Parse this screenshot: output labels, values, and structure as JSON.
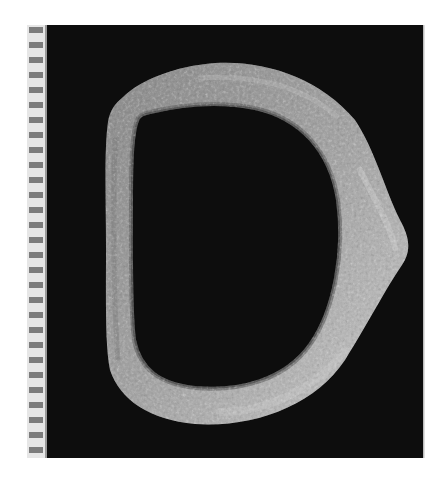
{
  "image": {
    "subject": "D-shaped corroded metal buckle frame",
    "background_color": "#0b0b0b",
    "page_color": "#ffffff",
    "object_color": "#9a9a9a",
    "object_highlight": "#c8c8c8",
    "object_shadow": "#5a5a5a"
  },
  "scale_bar": {
    "orientation": "vertical",
    "position": "left",
    "tick_count": 28,
    "tick_color": "#7a7a7a",
    "strip_color": "#e4e4e4"
  }
}
